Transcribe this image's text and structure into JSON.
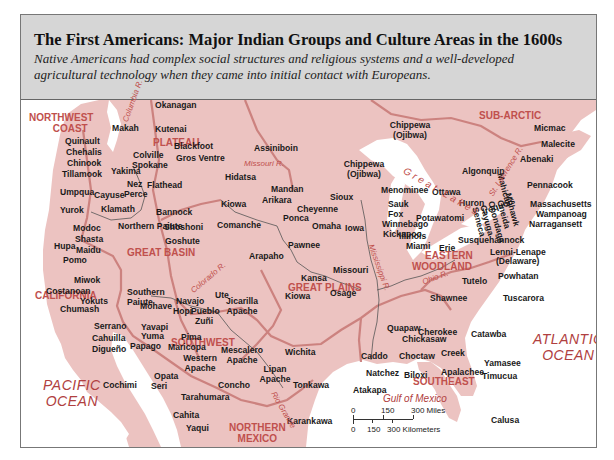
{
  "header": {
    "title": "The First Americans: Major Indian Groups and Culture Areas in the 1600s",
    "subtitle": "Native Americans had complex social structures and religious systems and a well-developed agricultural technology when they came into initial contact with Europeans."
  },
  "colors": {
    "land": "#ecc3c1",
    "water": "#ffffff",
    "border_lines": "#c97b78",
    "region_label": "#c0504d",
    "header_bg": "#d6d6d6"
  },
  "culture_areas": [
    "NORTHWEST COAST",
    "PLATEAU",
    "GREAT BASIN",
    "CALIFORNIA",
    "SOUTHWEST",
    "GREAT PLAINS",
    "SUB-ARCTIC",
    "EASTERN WOODLAND",
    "SOUTHEAST",
    "NORTHERN MEXICO"
  ],
  "regions": {
    "northwest_coast": [
      "NORTHWEST",
      "COAST"
    ],
    "plateau": "PLATEAU",
    "great_basin": "GREAT BASIN",
    "california": "CALIFORNIA",
    "southwest": "SOUTHWEST",
    "great_plains": "GREAT PLAINS",
    "sub_arctic": "SUB-ARCTIC",
    "eastern_woodland": [
      "EASTERN",
      "WOODLAND"
    ],
    "southeast": "SOUTHEAST",
    "northern_mexico": [
      "NORTHERN",
      "MEXICO"
    ]
  },
  "groups": {
    "northwest_coast": [
      "Makah",
      "Quinault",
      "Chehalis",
      "Chinook",
      "Tillamook",
      "Umpqua",
      "Yurok"
    ],
    "plateau": [
      "Okanagan",
      "Kutenai",
      "Colville",
      "Spokane",
      "Yakima",
      "Nez Perce",
      "Cayuse",
      "Flathead",
      "Klamath"
    ],
    "california": [
      "Modoc",
      "Shasta",
      "Hupa",
      "Maidu",
      "Pomo",
      "Miwok",
      "Costanoan",
      "Yokuts",
      "Chumash",
      "Serrano",
      "Cahuilla",
      "Digueño"
    ],
    "great_basin": [
      "Bannock",
      "Northern Paiute",
      "Shoshoni",
      "Goshute",
      "Southern Paiute",
      "Ute"
    ],
    "southwest": [
      "Mohave",
      "Navajo",
      "Hopi",
      "Pueblo",
      "Jicarilla Apache",
      "Zuñi",
      "Yavapi",
      "Yuma",
      "Papago",
      "Pima",
      "Maricopa",
      "Western Apache",
      "Mescalero Apache",
      "Lipan Apache"
    ],
    "great_plains": [
      "Blackfoot",
      "Gros Ventre",
      "Assiniboin",
      "Hidatsa",
      "Mandan",
      "Arikara",
      "Kiowa",
      "Sioux",
      "Cheyenne",
      "Ponca",
      "Omaha",
      "Iowa",
      "Comanche",
      "Pawnee",
      "Arapaho",
      "Missouri",
      "Kansa",
      "Kiowa",
      "Osage",
      "Wichita",
      "Tonkawa"
    ],
    "northern_mexico": [
      "Cochimi",
      "Opata",
      "Seri",
      "Concho",
      "Tarahumara",
      "Cahita",
      "Yaqui"
    ],
    "sub_arctic": [
      "Chippewa (Ojibwa)"
    ],
    "eastern_woodland": [
      "Chippewa (Ojibwa)",
      "Menominee",
      "Sauk",
      "Fox",
      "Winnebago",
      "Kickapoo",
      "Potawatomi",
      "Ottawa",
      "Algonquin",
      "Huron",
      "Micmac",
      "Malecite",
      "Abenaki",
      "Mahican",
      "Pennacook",
      "Massachusetts",
      "Wampanoag",
      "Narragansett",
      "Iroquois",
      "Mohawk",
      "Oneida",
      "Onondaga",
      "Cayuga",
      "Seneca",
      "Erie",
      "Miami",
      "Illinois",
      "Susquehannock",
      "Lenni-Lenape (Delaware)",
      "Powhatan",
      "Tutelo",
      "Shawnee",
      "Tuscarora"
    ],
    "southeast": [
      "Quapaw",
      "Chickasaw",
      "Cherokee",
      "Catawba",
      "Caddo",
      "Choctaw",
      "Creek",
      "Natchez",
      "Biloxi",
      "Apalachee",
      "Atakapa",
      "Karankawa",
      "Yamasee",
      "Timucua",
      "Calusa"
    ]
  },
  "labels": {
    "makah": "Makah",
    "quinault": "Quinault",
    "chehalis": "Chehalis",
    "chinook": "Chinook",
    "tillamook": "Tillamook",
    "umpqua": "Umpqua",
    "yurok": "Yurok",
    "okanagan": "Okanagan",
    "kutenai": "Kutenai",
    "colville": "Colville",
    "spokane": "Spokane",
    "yakima": "Yakima",
    "nez": "Nez",
    "perce": "Perce",
    "cayuse": "Cayuse",
    "flathead": "Flathead",
    "klamath": "Klamath",
    "blackfoot": "Blackfoot",
    "gros_ventre": "Gros Ventre",
    "assiniboin": "Assiniboin",
    "hidatsa": "Hidatsa",
    "mandan": "Mandan",
    "arikara": "Arikara",
    "modoc": "Modoc",
    "shasta": "Shasta",
    "hupa": "Hupa",
    "maidu": "Maidu",
    "pomo": "Pomo",
    "bannock": "Bannock",
    "northern_paiute": "Northern Paiute",
    "shoshoni": "Shoshoni",
    "goshute": "Goshute",
    "miwok": "Miwok",
    "costanoan": "Costanoan",
    "yokuts": "Yokuts",
    "southern_paiute": "Southern Paiute",
    "chumash": "Chumash",
    "serrano": "Serrano",
    "cahuilla": "Cahuilla",
    "digueno": "Digueño",
    "ute": "Ute",
    "mohave": "Mohave",
    "navajo": "Navajo",
    "hopi": "Hopi",
    "pueblo": "Pueblo",
    "jicarilla": "Jicarilla Apache",
    "zuni": "Zuñi",
    "yavapi": "Yavapi",
    "yuma": "Yuma",
    "papago": "Papago",
    "pima": "Pima",
    "maricopa": "Maricopa",
    "western_apache": "Western Apache",
    "mescalero": "Mescalero Apache",
    "lipan": "Lipan Apache",
    "opata": "Opata",
    "seri": "Seri",
    "cochimi": "Cochimi",
    "concho": "Concho",
    "tarahumara": "Tarahumara",
    "cahita": "Cahita",
    "yaqui": "Yaqui",
    "kiowa1": "Kiowa",
    "kiowa2": "Kiowa",
    "comanche": "Comanche",
    "sioux": "Sioux",
    "cheyenne": "Cheyenne",
    "ponca": "Ponca",
    "omaha": "Omaha",
    "iowa": "Iowa",
    "pawnee": "Pawnee",
    "arapaho": "Arapaho",
    "missouri": "Missouri",
    "kansa": "Kansa",
    "osage": "Osage",
    "wichita": "Wichita",
    "tonkawa": "Tonkawa",
    "karankawa": "Karankawa",
    "chippewa1": "Chippewa (Ojibwa)",
    "chippewa2": "Chippewa (Ojibwa)",
    "menominee": "Menominee",
    "sauk": "Sauk",
    "fox": "Fox",
    "winnebago": "Winnebago",
    "kickapoo": "Kickapoo",
    "potawatomi": "Potawatomi",
    "ottawa": "Ottawa",
    "algonquin": "Algonquin",
    "huron": "Huron",
    "micmac": "Micmac",
    "malecite": "Malecite",
    "abenaki": "Abenaki",
    "mahican": "Mahican",
    "pennacook": "Pennacook",
    "massachusetts": "Massachusetts",
    "wampanoag": "Wampanoag",
    "narragansett": "Narragansett",
    "iroquois": "Iroquois",
    "mohawk": "Mohawk",
    "oneida": "Oneida",
    "onondaga": "Onondaga",
    "cayuga": "Cayuga",
    "seneca": "Seneca",
    "erie": "Erie",
    "miami": "Miami",
    "illinois": "Illinois",
    "susquehannock": "Susquehannock",
    "lenape": "Lenni-Lenape",
    "delaware": "(Delaware)",
    "powhatan": "Powhatan",
    "tutelo": "Tutelo",
    "shawnee": "Shawnee",
    "tuscarora": "Tuscarora",
    "quapaw": "Quapaw",
    "chickasaw": "Chickasaw",
    "cherokee": "Cherokee",
    "catawba": "Catawba",
    "caddo": "Caddo",
    "choctaw": "Choctaw",
    "creek": "Creek",
    "natchez": "Natchez",
    "biloxi": "Biloxi",
    "apalachee": "Apalachee",
    "atakapa": "Atakapa",
    "yamasee": "Yamasee",
    "timucua": "Timucua",
    "calusa": "Calusa"
  },
  "rivers": {
    "columbia": "Columbia R.",
    "missouri": "Missouri R.",
    "colorado": "Colorado R.",
    "mississippi": "Mississippi R.",
    "ohio": "Ohio R.",
    "rio_grande": "Rio Grande",
    "st_lawrence": "St. Lawrence R.",
    "great_lakes": "Great Lakes"
  },
  "water_bodies": {
    "pacific": [
      "PACIFIC",
      "OCEAN"
    ],
    "atlantic": [
      "ATLANTIC",
      "OCEAN"
    ],
    "gulf": "Gulf of Mexico"
  },
  "scale_bar": {
    "miles_ticks": [
      "0",
      "150",
      "300 Miles"
    ],
    "km_ticks": [
      "0",
      "150",
      "300 Kilometers"
    ]
  }
}
